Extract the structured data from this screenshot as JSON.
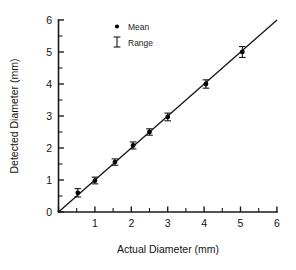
{
  "chart_data": {
    "type": "scatter",
    "title": "",
    "subtitle": "",
    "xlabel": "Actual Diameter (mm)",
    "ylabel": "Detected Diameter (mm)",
    "xlim": [
      0,
      6
    ],
    "ylim": [
      0,
      6
    ],
    "xticks": [
      0,
      1,
      2,
      3,
      4,
      5,
      6
    ],
    "yticks": [
      0,
      1,
      2,
      3,
      4,
      5,
      6
    ],
    "xticklabels": [
      "0",
      "1",
      "2",
      "3",
      "4",
      "5",
      "6"
    ],
    "yticklabels": [
      "0",
      "1",
      "2",
      "3",
      "4",
      "5",
      "6"
    ],
    "minor_tick_step": 0.5,
    "grid": false,
    "legend_position": "top-left-inside",
    "legend": [
      {
        "label": "Mean",
        "marker": "filled-circle"
      },
      {
        "label": "Range",
        "marker": "i-beam-error-bar"
      }
    ],
    "series": [
      {
        "name": "Mean",
        "marker": "filled-circle",
        "x": [
          0.53,
          1.0,
          1.55,
          2.05,
          2.5,
          3.0,
          4.05,
          5.05
        ],
        "y": [
          0.6,
          0.98,
          1.56,
          2.08,
          2.5,
          2.97,
          4.0,
          5.0
        ],
        "yerr_low": [
          0.13,
          0.1,
          0.1,
          0.11,
          0.1,
          0.12,
          0.13,
          0.17
        ],
        "yerr_high": [
          0.13,
          0.11,
          0.1,
          0.11,
          0.1,
          0.12,
          0.13,
          0.17
        ]
      }
    ],
    "reference_line": {
      "name": "identity",
      "type": "line",
      "slope": 1.0,
      "intercept": 0.0,
      "x": [
        0.0,
        6.0
      ],
      "y": [
        0.0,
        6.0
      ]
    },
    "annotations": []
  },
  "colors": {
    "marker": "#000000",
    "line": "#141414",
    "axis": "#1a1a1a",
    "text": "#121212",
    "background": "#ffffff"
  }
}
